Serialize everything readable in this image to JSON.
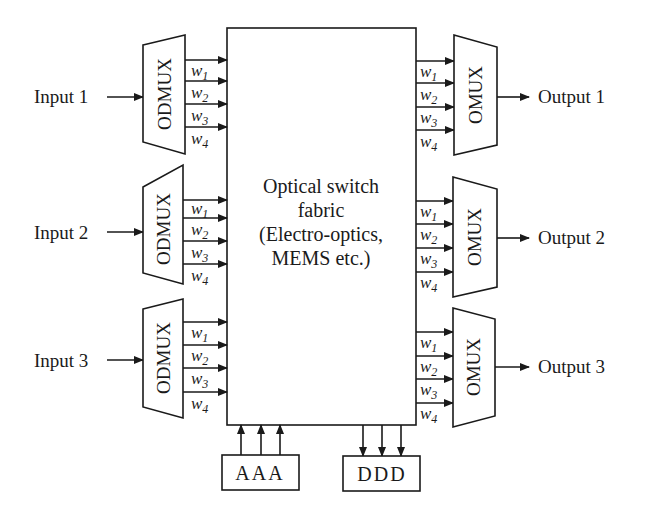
{
  "diagram": {
    "type": "block-diagram",
    "colors": {
      "line": "#1a1a1a",
      "background": "#ffffff"
    },
    "inputs": [
      {
        "label": "Input 1",
        "y": 97
      },
      {
        "label": "Input 2",
        "y": 232
      },
      {
        "label": "Input 3",
        "y": 360
      }
    ],
    "outputs": [
      {
        "label": "Output 1",
        "y": 97
      },
      {
        "label": "Output 2",
        "y": 238
      },
      {
        "label": "Output 3",
        "y": 367
      }
    ],
    "demux": {
      "label": "ODMUX",
      "units": [
        {
          "top_left": [
            143,
            45
          ],
          "top_right": [
            185,
            35
          ],
          "bottom_right": [
            185,
            154
          ],
          "bottom_left": [
            143,
            142
          ],
          "arrows_y": [
            60,
            81,
            104,
            127
          ]
        },
        {
          "top_left": [
            143,
            187
          ],
          "top_right": [
            183,
            165
          ],
          "bottom_right": [
            183,
            284
          ],
          "bottom_left": [
            143,
            273
          ],
          "arrows_y": [
            200,
            218,
            241,
            264
          ]
        },
        {
          "top_left": [
            143,
            309
          ],
          "top_right": [
            183,
            299
          ],
          "bottom_right": [
            183,
            418
          ],
          "bottom_left": [
            143,
            407
          ],
          "arrows_y": [
            322,
            345,
            368,
            392
          ]
        }
      ]
    },
    "mux": {
      "label": "OMUX",
      "units": [
        {
          "top_left": [
            454,
            35
          ],
          "top_right": [
            497,
            47
          ],
          "bottom_right": [
            497,
            145
          ],
          "bottom_left": [
            454,
            155
          ],
          "arrows_y": [
            61,
            83,
            107,
            130
          ]
        },
        {
          "top_left": [
            453,
            177
          ],
          "top_right": [
            497,
            189
          ],
          "bottom_right": [
            497,
            287
          ],
          "bottom_left": [
            453,
            297
          ],
          "arrows_y": [
            201,
            224,
            248,
            272
          ]
        },
        {
          "top_left": [
            453,
            308
          ],
          "top_right": [
            495,
            319
          ],
          "bottom_right": [
            495,
            416
          ],
          "bottom_left": [
            453,
            427
          ],
          "arrows_y": [
            332,
            356,
            379,
            403
          ]
        }
      ]
    },
    "wavelengths": [
      {
        "base": "w",
        "sub": "1"
      },
      {
        "base": "w",
        "sub": "2"
      },
      {
        "base": "w",
        "sub": "3"
      },
      {
        "base": "w",
        "sub": "4"
      }
    ],
    "switch_fabric": {
      "lines": [
        "Optical switch",
        "fabric",
        "(Electro-optics,",
        "MEMS etc.)"
      ]
    },
    "add_block": {
      "label": "AAA"
    },
    "drop_block": {
      "label": "DDD"
    }
  }
}
